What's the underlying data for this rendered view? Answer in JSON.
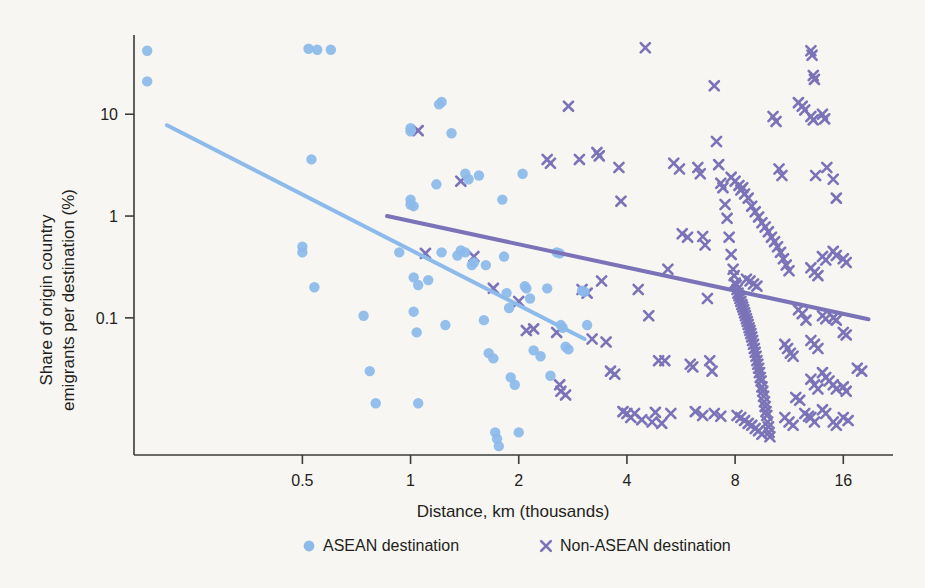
{
  "figure": {
    "background_color": "#f7f6f2",
    "axis_color": "#3b3b3b",
    "text_color": "#231f20"
  },
  "chart_data": {
    "type": "scatter",
    "title": "",
    "xlabel": "Distance, km (thousands)",
    "ylabel": "Share of origin country\nemigrants per destination (%)",
    "ylabel_line1": "Share of origin country",
    "ylabel_line2": "emigrants per destination (%)",
    "xscale": "log",
    "yscale": "log",
    "xlim": [
      0.17,
      22
    ],
    "ylim": [
      0.0045,
      60
    ],
    "xticks": [
      0.5,
      1,
      2,
      4,
      8,
      16
    ],
    "xtick_labels": [
      "0.5",
      "1",
      "2",
      "4",
      "8",
      "16"
    ],
    "yticks": [
      10,
      1,
      0.1
    ],
    "ytick_labels": [
      "10",
      "1",
      "0.1"
    ],
    "grid": false,
    "legend_position": "below",
    "legend": [
      {
        "label": "ASEAN destination",
        "marker": "circle",
        "color": "#8cbaea"
      },
      {
        "label": "Non-ASEAN destination",
        "marker": "x",
        "color": "#7b73b8"
      }
    ],
    "series": [
      {
        "name": "ASEAN destination",
        "marker": "circle",
        "color": "#8cbaea",
        "points": [
          [
            0.185,
            42
          ],
          [
            0.185,
            21
          ],
          [
            0.52,
            44
          ],
          [
            0.55,
            43
          ],
          [
            0.6,
            43
          ],
          [
            0.5,
            0.5
          ],
          [
            0.5,
            0.44
          ],
          [
            0.53,
            3.6
          ],
          [
            0.54,
            0.2
          ],
          [
            0.74,
            0.105
          ],
          [
            0.77,
            0.03
          ],
          [
            0.8,
            0.0145
          ],
          [
            1.0,
            1.3
          ],
          [
            1.0,
            1.45
          ],
          [
            1.02,
            1.25
          ],
          [
            1.0,
            6.8
          ],
          [
            1.0,
            7.3
          ],
          [
            1.02,
            0.25
          ],
          [
            1.05,
            0.21
          ],
          [
            1.02,
            0.115
          ],
          [
            1.04,
            0.072
          ],
          [
            1.05,
            0.0145
          ],
          [
            1.18,
            2.05
          ],
          [
            1.2,
            12.5
          ],
          [
            1.22,
            13.2
          ],
          [
            1.22,
            0.44
          ],
          [
            1.25,
            0.085
          ],
          [
            1.3,
            6.5
          ],
          [
            1.35,
            0.41
          ],
          [
            1.42,
            2.6
          ],
          [
            1.45,
            2.3
          ],
          [
            1.48,
            0.33
          ],
          [
            1.5,
            0.35
          ],
          [
            1.55,
            2.5
          ],
          [
            1.6,
            0.095
          ],
          [
            1.65,
            0.045
          ],
          [
            1.7,
            0.04
          ],
          [
            1.72,
            0.0075
          ],
          [
            1.74,
            0.0065
          ],
          [
            1.76,
            0.0055
          ],
          [
            1.8,
            1.45
          ],
          [
            1.82,
            0.4
          ],
          [
            1.85,
            0.175
          ],
          [
            1.88,
            0.125
          ],
          [
            1.9,
            0.026
          ],
          [
            1.95,
            0.022
          ],
          [
            2.0,
            0.0075
          ],
          [
            2.05,
            2.6
          ],
          [
            2.1,
            0.195
          ],
          [
            2.15,
            0.155
          ],
          [
            2.2,
            0.048
          ],
          [
            2.3,
            0.042
          ],
          [
            2.4,
            0.195
          ],
          [
            2.45,
            0.027
          ],
          [
            2.55,
            0.44
          ],
          [
            2.6,
            0.43
          ],
          [
            2.62,
            0.085
          ],
          [
            2.65,
            0.08
          ],
          [
            2.7,
            0.052
          ],
          [
            2.75,
            0.049
          ],
          [
            3.0,
            0.185
          ],
          [
            3.05,
            0.18
          ],
          [
            3.1,
            0.085
          ],
          [
            0.93,
            0.44
          ],
          [
            1.12,
            0.235
          ],
          [
            1.38,
            0.46
          ],
          [
            1.42,
            0.44
          ],
          [
            1.62,
            0.33
          ],
          [
            2.08,
            0.205
          ]
        ]
      },
      {
        "name": "Non-ASEAN destination",
        "marker": "x",
        "color": "#7b73b8",
        "points": [
          [
            1.05,
            6.9
          ],
          [
            1.1,
            0.43
          ],
          [
            1.38,
            2.2
          ],
          [
            1.5,
            0.4
          ],
          [
            1.7,
            0.195
          ],
          [
            2.0,
            0.145
          ],
          [
            2.1,
            0.075
          ],
          [
            2.2,
            0.078
          ],
          [
            2.4,
            3.6
          ],
          [
            2.45,
            3.3
          ],
          [
            2.55,
            0.072
          ],
          [
            2.6,
            0.022
          ],
          [
            2.62,
            0.019
          ],
          [
            2.7,
            0.0175
          ],
          [
            2.75,
            12.0
          ],
          [
            2.95,
            3.6
          ],
          [
            3.0,
            0.19
          ],
          [
            3.1,
            0.175
          ],
          [
            3.2,
            0.062
          ],
          [
            3.3,
            4.2
          ],
          [
            3.35,
            3.9
          ],
          [
            3.4,
            0.23
          ],
          [
            3.5,
            0.058
          ],
          [
            3.6,
            0.03
          ],
          [
            3.7,
            0.028
          ],
          [
            3.8,
            3.0
          ],
          [
            3.85,
            1.4
          ],
          [
            3.9,
            0.012
          ],
          [
            4.0,
            0.0115
          ],
          [
            4.1,
            0.0105
          ],
          [
            4.3,
            0.19
          ],
          [
            4.4,
            0.01
          ],
          [
            4.5,
            45
          ],
          [
            4.6,
            0.105
          ],
          [
            4.7,
            0.0095
          ],
          [
            4.9,
            0.038
          ],
          [
            5.0,
            0.0092
          ],
          [
            5.2,
            0.3
          ],
          [
            5.4,
            3.3
          ],
          [
            5.6,
            2.9
          ],
          [
            5.7,
            0.67
          ],
          [
            5.9,
            0.62
          ],
          [
            6.0,
            0.035
          ],
          [
            6.1,
            0.033
          ],
          [
            6.3,
            3.0
          ],
          [
            6.4,
            2.6
          ],
          [
            6.5,
            0.63
          ],
          [
            6.6,
            0.52
          ],
          [
            6.7,
            0.155
          ],
          [
            6.8,
            0.038
          ],
          [
            6.9,
            0.03
          ],
          [
            7.0,
            19
          ],
          [
            7.1,
            5.4
          ],
          [
            7.2,
            3.2
          ],
          [
            7.3,
            2.1
          ],
          [
            7.4,
            1.9
          ],
          [
            7.5,
            1.3
          ],
          [
            7.6,
            0.95
          ],
          [
            7.7,
            0.62
          ],
          [
            7.8,
            0.42
          ],
          [
            7.9,
            0.3
          ],
          [
            7.95,
            0.26
          ],
          [
            8.0,
            0.22
          ],
          [
            8.05,
            0.21
          ],
          [
            8.1,
            0.19
          ],
          [
            8.15,
            0.175
          ],
          [
            8.2,
            0.165
          ],
          [
            8.25,
            0.155
          ],
          [
            8.3,
            0.145
          ],
          [
            8.35,
            0.135
          ],
          [
            8.4,
            0.128
          ],
          [
            8.45,
            0.12
          ],
          [
            8.5,
            0.112
          ],
          [
            8.55,
            0.105
          ],
          [
            8.6,
            0.098
          ],
          [
            8.65,
            0.092
          ],
          [
            8.7,
            0.086
          ],
          [
            8.75,
            0.08
          ],
          [
            8.8,
            0.075
          ],
          [
            8.85,
            0.07
          ],
          [
            8.9,
            0.065
          ],
          [
            8.95,
            0.06
          ],
          [
            9.0,
            0.055
          ],
          [
            9.05,
            0.05
          ],
          [
            9.1,
            0.046
          ],
          [
            9.15,
            0.042
          ],
          [
            9.2,
            0.038
          ],
          [
            9.25,
            0.035
          ],
          [
            9.3,
            0.032
          ],
          [
            9.35,
            0.029
          ],
          [
            9.4,
            0.026
          ],
          [
            9.45,
            0.024
          ],
          [
            9.5,
            0.021
          ],
          [
            9.55,
            0.019
          ],
          [
            9.6,
            0.017
          ],
          [
            9.65,
            0.015
          ],
          [
            9.7,
            0.0135
          ],
          [
            9.75,
            0.012
          ],
          [
            9.8,
            0.011
          ],
          [
            9.85,
            0.0095
          ],
          [
            9.9,
            0.0085
          ],
          [
            9.95,
            0.0075
          ],
          [
            10.0,
            0.0068
          ],
          [
            8.3,
            1.8
          ],
          [
            8.5,
            1.65
          ],
          [
            8.7,
            1.5
          ],
          [
            8.9,
            1.25
          ],
          [
            9.1,
            1.1
          ],
          [
            9.3,
            0.98
          ],
          [
            9.5,
            0.86
          ],
          [
            9.7,
            0.78
          ],
          [
            9.9,
            0.7
          ],
          [
            10.1,
            0.62
          ],
          [
            10.3,
            0.56
          ],
          [
            10.5,
            0.5
          ],
          [
            10.7,
            0.44
          ],
          [
            10.9,
            0.38
          ],
          [
            11.1,
            0.33
          ],
          [
            11.3,
            0.29
          ],
          [
            7.8,
            2.4
          ],
          [
            8.0,
            2.2
          ],
          [
            8.2,
            2.0
          ],
          [
            8.4,
            1.9
          ],
          [
            8.6,
            0.24
          ],
          [
            8.8,
            0.23
          ],
          [
            9.0,
            0.215
          ],
          [
            9.2,
            0.205
          ],
          [
            8.1,
            0.011
          ],
          [
            8.3,
            0.0105
          ],
          [
            8.5,
            0.0098
          ],
          [
            8.7,
            0.0092
          ],
          [
            8.9,
            0.0088
          ],
          [
            9.1,
            0.0082
          ],
          [
            9.3,
            0.0078
          ],
          [
            9.5,
            0.0072
          ],
          [
            10.2,
            9.5
          ],
          [
            10.4,
            8.5
          ],
          [
            10.6,
            2.9
          ],
          [
            10.8,
            2.5
          ],
          [
            11.0,
            0.055
          ],
          [
            11.2,
            0.05
          ],
          [
            11.4,
            0.045
          ],
          [
            11.6,
            0.042
          ],
          [
            11.0,
            0.0105
          ],
          [
            11.3,
            0.0095
          ],
          [
            11.6,
            0.0088
          ],
          [
            12.0,
            0.12
          ],
          [
            12.3,
            0.11
          ],
          [
            12.6,
            0.095
          ],
          [
            12.0,
            13.0
          ],
          [
            12.3,
            12.0
          ],
          [
            12.5,
            11.0
          ],
          [
            13.0,
            42
          ],
          [
            13.1,
            38
          ],
          [
            13.2,
            24
          ],
          [
            13.3,
            22
          ],
          [
            13.0,
            9.5
          ],
          [
            13.2,
            8.8
          ],
          [
            13.4,
            2.5
          ],
          [
            13.0,
            0.31
          ],
          [
            13.3,
            0.28
          ],
          [
            13.6,
            0.26
          ],
          [
            13.0,
            0.06
          ],
          [
            13.3,
            0.055
          ],
          [
            13.6,
            0.05
          ],
          [
            13.0,
            0.025
          ],
          [
            13.3,
            0.022
          ],
          [
            13.6,
            0.02
          ],
          [
            13.0,
            0.0105
          ],
          [
            13.3,
            0.0095
          ],
          [
            14.0,
            10.0
          ],
          [
            14.2,
            9.0
          ],
          [
            14.4,
            3.0
          ],
          [
            14.0,
            0.4
          ],
          [
            14.3,
            0.37
          ],
          [
            14.0,
            0.105
          ],
          [
            14.3,
            0.098
          ],
          [
            14.0,
            0.029
          ],
          [
            14.3,
            0.026
          ],
          [
            14.6,
            0.024
          ],
          [
            14.0,
            0.0125
          ],
          [
            14.3,
            0.0115
          ],
          [
            15.0,
            2.3
          ],
          [
            15.3,
            1.5
          ],
          [
            15.0,
            0.45
          ],
          [
            15.3,
            0.41
          ],
          [
            15.0,
            0.1
          ],
          [
            15.3,
            0.095
          ],
          [
            15.0,
            0.022
          ],
          [
            15.3,
            0.02
          ],
          [
            15.0,
            0.0095
          ],
          [
            15.3,
            0.0088
          ],
          [
            16.0,
            0.38
          ],
          [
            16.3,
            0.35
          ],
          [
            16.0,
            0.072
          ],
          [
            16.3,
            0.068
          ],
          [
            16.0,
            0.021
          ],
          [
            16.3,
            0.019
          ],
          [
            16.0,
            0.0105
          ],
          [
            16.5,
            0.0098
          ],
          [
            17.5,
            0.032
          ],
          [
            18.0,
            0.03
          ],
          [
            6.2,
            0.012
          ],
          [
            6.5,
            0.011
          ],
          [
            5.1,
            0.038
          ],
          [
            5.3,
            0.0115
          ],
          [
            4.2,
            0.0115
          ],
          [
            4.8,
            0.0118
          ],
          [
            7.0,
            0.0115
          ],
          [
            7.3,
            0.0108
          ],
          [
            11.8,
            0.0165
          ],
          [
            12.1,
            0.0155
          ],
          [
            12.5,
            0.0115
          ],
          [
            12.8,
            0.0108
          ]
        ]
      }
    ],
    "trendlines": [
      {
        "name": "ASEAN trendline",
        "color": "#8cbaea",
        "x_start": 0.21,
        "y_start": 7.8,
        "x_end": 3.05,
        "y_end": 0.062
      },
      {
        "name": "Non-ASEAN trendline",
        "color": "#7b73b8",
        "x_start": 0.86,
        "y_start": 1.0,
        "x_end": 18.8,
        "y_end": 0.097
      }
    ]
  }
}
